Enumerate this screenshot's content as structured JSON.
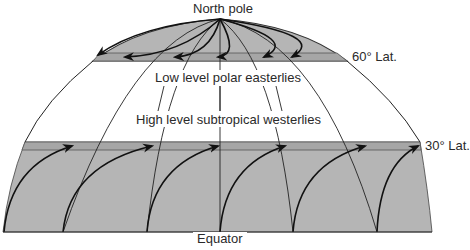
{
  "diagram": {
    "labels": {
      "north_pole": "North pole",
      "lat60": "60° Lat.",
      "lat30": "30° Lat.",
      "polar": "Low level polar easterlies",
      "subtropical": "High level subtropical westerlies",
      "equator": "Equator"
    },
    "colors": {
      "shade": "#b5b5b5",
      "band": "#a9a9a9",
      "line": "#1a1a1a",
      "background": "#ffffff"
    },
    "regions": [
      {
        "name": "polar-cap",
        "from": "North pole",
        "to": "60° Lat.",
        "wind": "Low level polar easterlies",
        "direction": "east-to-west"
      },
      {
        "name": "tropics",
        "from": "30° Lat.",
        "to": "Equator",
        "wind": "High level subtropical westerlies",
        "direction": "west-to-east"
      }
    ]
  }
}
